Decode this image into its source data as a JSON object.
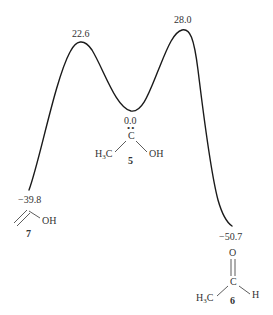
{
  "diagram": {
    "type": "reaction-energy-profile",
    "curve_color": "#1a1a1a",
    "points": [
      {
        "id": "7",
        "energy": "-39.8",
        "role": "product"
      },
      {
        "id": "TS1",
        "energy": "22.6",
        "role": "transition-state"
      },
      {
        "id": "5",
        "energy": "0.0",
        "role": "reactant"
      },
      {
        "id": "TS2",
        "energy": "28.0",
        "role": "transition-state"
      },
      {
        "id": "6",
        "energy": "-50.7",
        "role": "product"
      }
    ],
    "labels": {
      "ts1_energy": "22.6",
      "ts2_energy": "28.0",
      "reactant_energy": "0.0",
      "left_product_energy": "−39.8",
      "right_product_energy": "−50.7"
    },
    "compound_5": {
      "number": "5",
      "central_atom": "C",
      "lone_pair": "••",
      "left_group": "H",
      "left_group_sub": "3",
      "left_group_tail": "C",
      "right_group": "OH"
    },
    "compound_7": {
      "number": "7",
      "group": "OH"
    },
    "compound_6": {
      "number": "6",
      "top_atom": "O",
      "central_atom": "C",
      "left_group": "H",
      "left_group_sub": "3",
      "left_group_tail": "C",
      "right_group": "H"
    }
  }
}
